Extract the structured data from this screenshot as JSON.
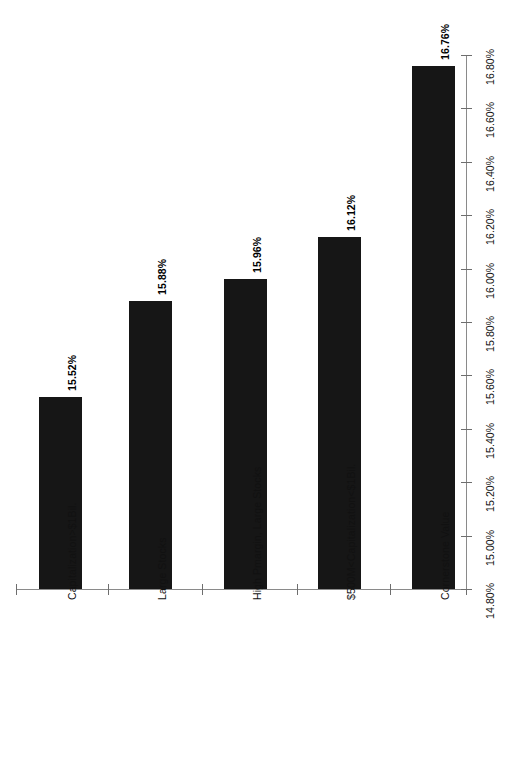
{
  "chart_data": {
    "type": "bar",
    "title": "",
    "subtitle": "",
    "xlabel": "",
    "ylabel": "",
    "orientation": "vertical-rotated",
    "grid": false,
    "legend": "none",
    "categories": [
      "Capitalization>$1Bil.",
      "Large Stocks",
      "High Pmargin, Large Stocks",
      "$500M<Capitalization<$1Bil.",
      "Cornerstone Value"
    ],
    "values": [
      15.52,
      15.88,
      15.96,
      16.12,
      16.76
    ],
    "value_labels": [
      "15.52%",
      "15.88%",
      "15.96%",
      "16.12%",
      "16.76%"
    ],
    "ylim": [
      14.8,
      16.8
    ],
    "ytick_step": 0.2,
    "ytick_labels": [
      "14.80%",
      "15.00%",
      "15.20%",
      "15.40%",
      "15.60%",
      "15.80%",
      "16.00%",
      "16.20%",
      "16.40%",
      "16.60%",
      "16.80%"
    ],
    "ytick_values": [
      14.8,
      15.0,
      15.2,
      15.4,
      15.6,
      15.8,
      16.0,
      16.2,
      16.4,
      16.6,
      16.8
    ],
    "bar_color": "#161616",
    "axis_color": "#8a8a8a",
    "background_color": "#ffffff"
  }
}
